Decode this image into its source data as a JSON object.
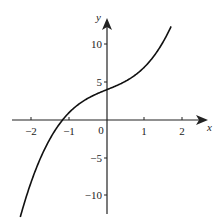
{
  "chart_data": {
    "type": "line",
    "title": "",
    "xlabel": "x",
    "ylabel": "y",
    "x_ticks": [
      -2,
      -1,
      0,
      1,
      2
    ],
    "x_tick_labels": [
      "−2",
      "−1",
      "0",
      "1",
      "2"
    ],
    "y_ticks": [
      10,
      5,
      -5,
      -10
    ],
    "y_tick_labels": [
      "10",
      "5",
      "−5",
      "−10"
    ],
    "xlim": [
      -2.5,
      2.5
    ],
    "ylim": [
      -12.5,
      13
    ],
    "grid": false,
    "legend": null,
    "series": [
      {
        "name": "curve",
        "x": [
          -2.3,
          -2.0,
          -1.5,
          -1.2,
          -1.0,
          -0.5,
          0,
          0.5,
          1.0,
          1.5,
          1.7
        ],
        "values": [
          -12.8,
          -8.0,
          -2.4,
          -0.1,
          1.0,
          2.9,
          4.0,
          5.1,
          7.0,
          10.4,
          12.3
        ]
      }
    ],
    "annotations": [
      "origin label 0"
    ]
  }
}
